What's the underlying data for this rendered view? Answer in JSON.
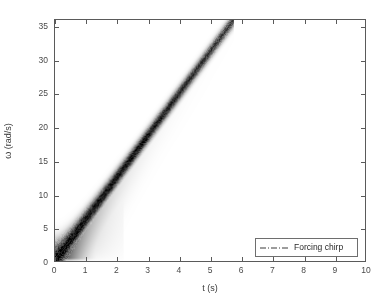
{
  "chart_data": {
    "type": "line",
    "title": "",
    "xlabel": "t (s)",
    "ylabel": "ω (rad/s)",
    "xlim": [
      0,
      10
    ],
    "ylim": [
      0,
      36
    ],
    "xticks": [
      0,
      1,
      2,
      3,
      4,
      5,
      6,
      7,
      8,
      9,
      10
    ],
    "xtick_labels": [
      "0",
      "1",
      "2",
      "3",
      "4",
      "5",
      "6",
      "7",
      "8",
      "9",
      "10"
    ],
    "yticks": [
      0,
      5,
      10,
      15,
      20,
      25,
      30,
      35
    ],
    "ytick_labels": [
      "0",
      "5",
      "10",
      "15",
      "20",
      "25",
      "30",
      "35"
    ],
    "grid": false,
    "legend_position": "lower-right",
    "background_image": "spectrogram-grayscale",
    "colormap": "grayscale-inverted",
    "series": [
      {
        "name": "Forcing chirp",
        "linestyle": "dash-dot",
        "color": "#2a2a2a",
        "x": [
          0,
          1,
          2,
          3,
          4,
          5,
          5.76
        ],
        "values": [
          0,
          6.25,
          12.5,
          18.75,
          25.0,
          31.25,
          36.0
        ]
      },
      {
        "name": "Spectrogram ridge",
        "linestyle": "solid",
        "color": "#1a1a1a",
        "x": [
          0,
          1,
          2,
          3,
          4,
          5,
          5.76
        ],
        "values": [
          0,
          6.25,
          12.5,
          18.75,
          25.0,
          31.25,
          36.0
        ]
      }
    ],
    "annotations": []
  },
  "legend": {
    "entries": [
      {
        "label": "Forcing chirp",
        "icon": "dash-dot-line-icon"
      }
    ]
  },
  "axes": {
    "x_title": "t (s)",
    "y_title": "ω (rad/s)"
  }
}
